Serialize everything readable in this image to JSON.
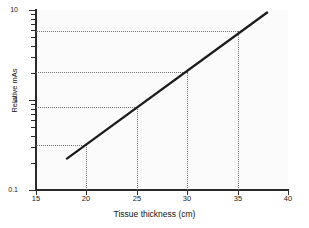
{
  "chart_data": {
    "type": "line",
    "title": "",
    "xlabel": "Tissue thickness (cm)",
    "ylabel": "Relative mAs",
    "xlim": [
      15,
      40
    ],
    "ylim": [
      0.1,
      10
    ],
    "yscale": "log",
    "grid": false,
    "legend": null,
    "xticks": [
      15,
      20,
      25,
      30,
      35,
      40
    ],
    "xticklabels": [
      "15",
      "20",
      "25",
      "30",
      "35",
      "40"
    ],
    "yticks": [
      0.1,
      1,
      10
    ],
    "yticklabels": [
      "0.1",
      "1",
      "10"
    ],
    "y_minor_ticks": [
      0.2,
      0.3,
      0.4,
      0.5,
      0.6,
      0.7,
      0.8,
      0.9,
      2,
      3,
      4,
      5,
      6,
      7,
      8,
      9
    ],
    "series": [
      {
        "name": "Relative mAs",
        "x": [
          18,
          38
        ],
        "y": [
          0.22,
          9.5
        ],
        "style": "solid",
        "color": "#1a1a1a",
        "width": 2.2
      }
    ],
    "annotations": [
      {
        "kind": "guide",
        "x": 20,
        "y": 0.32
      },
      {
        "kind": "guide",
        "x": 25,
        "y": 0.84
      },
      {
        "kind": "guide",
        "x": 30,
        "y": 2.05
      },
      {
        "kind": "guide",
        "x": 35,
        "y": 5.9
      }
    ],
    "guide_style": "dotted",
    "guide_color": "#6f6f6f"
  },
  "axes": {
    "x": {
      "label": "Tissue thickness (cm)",
      "ticks": [
        {
          "value": 15,
          "label": "15"
        },
        {
          "value": 20,
          "label": "20"
        },
        {
          "value": 25,
          "label": "25"
        },
        {
          "value": 30,
          "label": "30"
        },
        {
          "value": 35,
          "label": "35"
        },
        {
          "value": 40,
          "label": "40"
        }
      ]
    },
    "y": {
      "label": "Relative mAs",
      "ticks": [
        {
          "value": 10,
          "label": "10"
        },
        {
          "value": 1,
          "label": "1"
        },
        {
          "value": 0.1,
          "label": "0.1"
        }
      ]
    }
  },
  "colors": {
    "line": "#1a1a1a",
    "axis": "#2b2b2b",
    "guide": "#6f6f6f",
    "plot_background": "#fbfbfb",
    "figure_background": "#ffffff"
  }
}
